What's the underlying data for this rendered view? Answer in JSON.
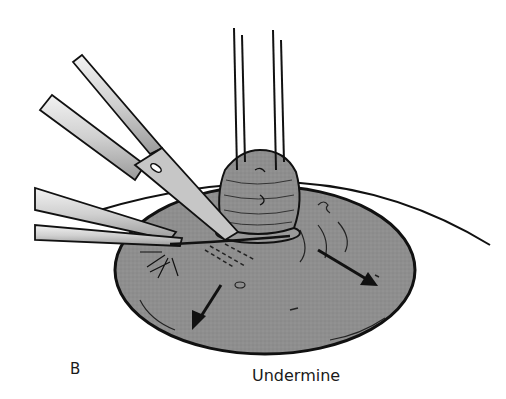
{
  "figure": {
    "panel_label": "B",
    "caption": "Undermine",
    "colors": {
      "tissue": "#8e8e8e",
      "mass": "#8a8a8a",
      "outline": "#111111",
      "instrument_light": "#e6e6e6",
      "instrument_mid": "#b5b5b5",
      "background": "#ffffff"
    },
    "elements": [
      "scissors",
      "forceps",
      "traction-sutures",
      "lesion-mass",
      "skin-disc",
      "undermine-arrows"
    ]
  }
}
